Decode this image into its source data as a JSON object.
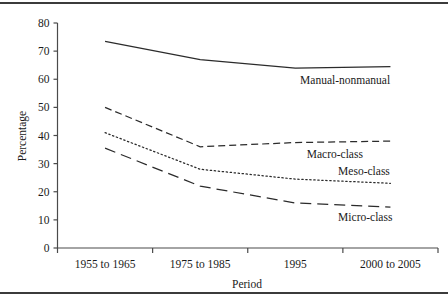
{
  "figure": {
    "rule_top": "horizontal-rule",
    "rule_bottom": "horizontal-rule"
  },
  "chart_data": {
    "type": "line",
    "title": "",
    "xlabel": "Period",
    "ylabel": "Percentage",
    "categories": [
      "1955 to 1965",
      "1975 to 1985",
      "1995",
      "2000 to 2005"
    ],
    "x": [
      0,
      1,
      2,
      3
    ],
    "ylim": [
      0,
      80
    ],
    "yticks": [
      0,
      10,
      20,
      30,
      40,
      50,
      60,
      70,
      80
    ],
    "ytick_labels": [
      "0",
      "10",
      "20",
      "30",
      "40",
      "50",
      "60",
      "70",
      "80"
    ],
    "grid": false,
    "legend": "inline-labels",
    "series": [
      {
        "name": "Manual-nonmanual",
        "style": "solid",
        "label": "Manual-nonmanual",
        "values": [
          73.5,
          67.0,
          64.0,
          64.5
        ]
      },
      {
        "name": "Macro-class",
        "style": "dashed",
        "label": "Macro-class",
        "values": [
          50.0,
          36.0,
          37.5,
          38.0
        ]
      },
      {
        "name": "Meso-class",
        "style": "dotted",
        "label": "Meso-class",
        "values": [
          41.0,
          28.0,
          24.5,
          23.0
        ]
      },
      {
        "name": "Micro-class",
        "style": "longdash",
        "label": "Micro-class",
        "values": [
          35.5,
          22.0,
          16.0,
          14.5
        ]
      }
    ]
  }
}
